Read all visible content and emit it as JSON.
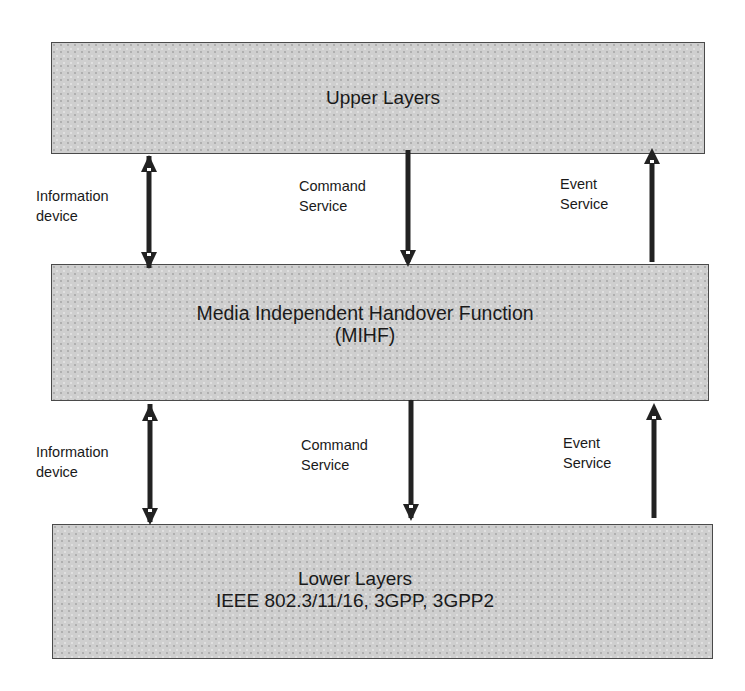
{
  "diagram": {
    "type": "layered-architecture",
    "boxes": {
      "upper": {
        "lines": [
          "Upper Layers"
        ]
      },
      "mihf": {
        "lines": [
          "Media Independent Handover Function",
          "(MIHF)"
        ]
      },
      "lower": {
        "lines": [
          "Lower Layers",
          "IEEE 802.3/11/16, 3GPP, 3GPP2"
        ]
      }
    },
    "upper_interface": {
      "information": {
        "lines": [
          "Information",
          "device"
        ],
        "direction": "bidirectional"
      },
      "command": {
        "lines": [
          "Command",
          "Service"
        ],
        "direction": "down"
      },
      "event": {
        "lines": [
          "Event",
          "Service"
        ],
        "direction": "up"
      }
    },
    "lower_interface": {
      "information": {
        "lines": [
          "Information",
          "device"
        ],
        "direction": "bidirectional"
      },
      "command": {
        "lines": [
          "Command",
          "Service"
        ],
        "direction": "down"
      },
      "event": {
        "lines": [
          "Event",
          "Service"
        ],
        "direction": "up"
      }
    },
    "colors": {
      "box_fill": "#cfcfcf",
      "box_border": "#4a4a4a",
      "arrow": "#222222",
      "text": "#1a1a1a"
    }
  }
}
